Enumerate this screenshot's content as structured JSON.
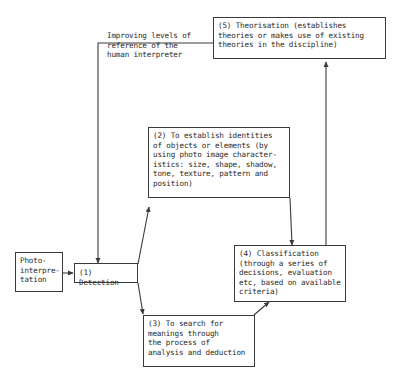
{
  "diagram": {
    "nodes": {
      "photo_interpretation": "Photo-\ninterpre-\ntation",
      "detection": "(1) Detection",
      "identities": "(2) To establish identities\nof objects or elements (by\nusing photo image character-\nistics: size, shape, shadow,\ntone, texture, pattern and\nposition)",
      "search": "(3) To search for\nmeanings through\nthe process of\nanalysis and deduction",
      "classification": "(4) Classification\n(through a series of\ndecisions, evaluation\netc, based on available\ncriteria)",
      "theorisation": "(5) Theorisation (establishes\ntheories or makes use of existing\ntheories in the discipline)"
    },
    "feedback_label": "Improving levels of\nreference of the\nhuman interpreter",
    "edges": [
      {
        "from": "photo_interpretation",
        "to": "detection"
      },
      {
        "from": "detection",
        "to": "identities"
      },
      {
        "from": "detection",
        "to": "search"
      },
      {
        "from": "identities",
        "to": "classification"
      },
      {
        "from": "search",
        "to": "classification"
      },
      {
        "from": "classification",
        "to": "theorisation"
      },
      {
        "from": "theorisation",
        "to": "detection",
        "label": "Improving levels of reference of the human interpreter"
      }
    ],
    "colors": {
      "line": "#3a3a3a",
      "text": "#2a2a2a",
      "background": "#fefefe"
    }
  }
}
